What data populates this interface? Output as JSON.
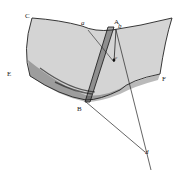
{
  "figure": {
    "labels": {
      "C": "C",
      "a": "a",
      "A": "A",
      "b": "b",
      "c": "c",
      "E": "E",
      "F": "F",
      "B": "B",
      "d": "d"
    },
    "colors": {
      "ink": "#222222",
      "background": "#ffffff"
    }
  }
}
